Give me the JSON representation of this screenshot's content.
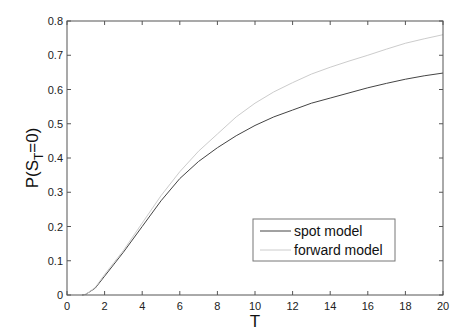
{
  "chart_data": {
    "type": "line",
    "title": "",
    "xlabel": "T",
    "ylabel": "P(S_T=0)",
    "xlim": [
      0,
      20
    ],
    "ylim": [
      0,
      0.8
    ],
    "grid": false,
    "legend_position": "lower right",
    "x_ticks": [
      "0",
      "2",
      "4",
      "6",
      "8",
      "10",
      "12",
      "14",
      "16",
      "18",
      "20"
    ],
    "y_ticks": [
      "0",
      "0.1",
      "0.2",
      "0.3",
      "0.4",
      "0.5",
      "0.6",
      "0.7",
      "0.8"
    ],
    "x": [
      0.8,
      1,
      1.5,
      2,
      2.5,
      3,
      4,
      5,
      6,
      7,
      8,
      9,
      10,
      11,
      12,
      13,
      14,
      15,
      16,
      17,
      18,
      19,
      20
    ],
    "series": [
      {
        "name": "spot model",
        "color": "#444444",
        "values": [
          0,
          0.002,
          0.02,
          0.055,
          0.09,
          0.125,
          0.2,
          0.275,
          0.34,
          0.39,
          0.43,
          0.465,
          0.495,
          0.52,
          0.54,
          0.56,
          0.575,
          0.59,
          0.605,
          0.618,
          0.63,
          0.64,
          0.648
        ]
      },
      {
        "name": "forward model",
        "color": "#cccccc",
        "values": [
          0,
          0.002,
          0.022,
          0.06,
          0.095,
          0.13,
          0.21,
          0.29,
          0.36,
          0.42,
          0.47,
          0.52,
          0.56,
          0.593,
          0.62,
          0.645,
          0.665,
          0.683,
          0.7,
          0.718,
          0.735,
          0.748,
          0.76
        ]
      }
    ]
  },
  "labels": {
    "xlabel": "T",
    "ylabel_main": "P(S",
    "ylabel_sub": "T",
    "ylabel_tail": "=0)",
    "legend": [
      "spot model",
      "forward model"
    ]
  }
}
